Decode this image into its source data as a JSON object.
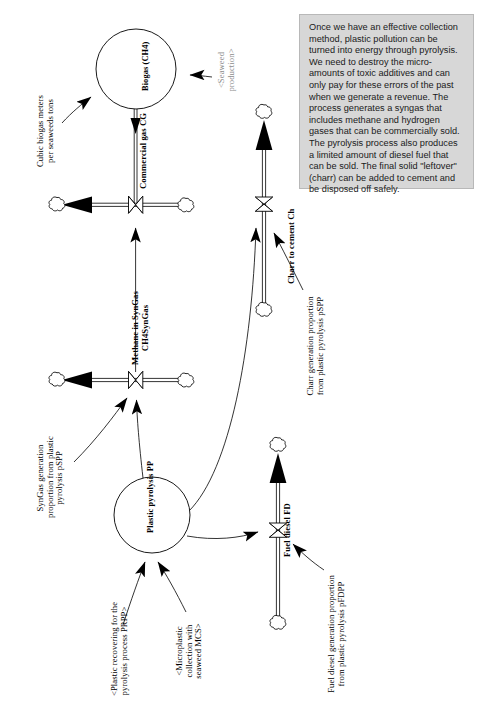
{
  "diagram": {
    "note": {
      "text": "Once we have an effective collection method, plastic pollution can be turned into energy through pyrolysis. We need to destroy the micro-amounts of toxic additives and can only pay for these errors of the past when we generate a revenue. The process generates a syngas that includes methane and hydrogen gases that can be commercially sold. The pyrolysis process also produces a limited amount of diesel fuel that can be sold. The final solid \"leftover\" (charr) can be added to cement and be disposed off safely.",
      "background_color": "#d7d7d7"
    },
    "stocks": [
      {
        "id": "biogas",
        "label": "Biogas (CH4)"
      },
      {
        "id": "plastic_pyrolysis",
        "label": "Plastic pyrolysis PP"
      }
    ],
    "flows": [
      {
        "id": "commercial_gas",
        "label": "Commercial gas CG"
      },
      {
        "id": "methane_syngas",
        "label": "Methane in SynGas\nCH4SynGas"
      },
      {
        "id": "charr_cement",
        "label": "Charr to cement Ch"
      },
      {
        "id": "fuel_diesel",
        "label": "Fuel diesel FD"
      }
    ],
    "variables": [
      {
        "id": "cubic_biogas",
        "label": "Cubic biogas meters\nper seaweeds tons",
        "color": "#000000"
      },
      {
        "id": "seaweed_production",
        "label": "<Seaweed\nproduction>",
        "color": "#8d8d8d"
      },
      {
        "id": "charr_proportion",
        "label": "Charr generation proportion\nfrom plastic pyrolysis pSPP",
        "color": "#000000"
      },
      {
        "id": "syngas_proportion",
        "label": "SynGas generation\nproportion from plastic\npyrolysis pSPP",
        "color": "#000000"
      },
      {
        "id": "plastic_recovering",
        "label": "<Plastic recovering for the\npyrolysis process PRPP>",
        "color": "#000000"
      },
      {
        "id": "microplastic_collection",
        "label": "<Microplastic\ncollection with\nseaweed MCS>",
        "color": "#000000"
      },
      {
        "id": "fuel_diesel_proportion",
        "label": "Fuel diesel generation proportion\nfrom plastic pyrolysis pFDPP",
        "color": "#000000"
      }
    ]
  }
}
